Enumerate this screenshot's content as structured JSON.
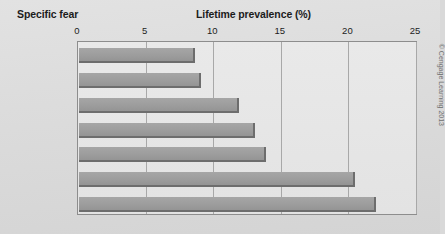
{
  "headings": {
    "category": "Specific fear",
    "value": "Lifetime prevalence (%)"
  },
  "credit": "© Cengage Learning 2013",
  "colors": {
    "bar_fill": "#9d9d9d",
    "bar_edge": "#6d6d6d",
    "plot_bg": "#e6e6e6",
    "frame": "#8d8d8d",
    "gridline": "#a8a8a8",
    "page_bg": "#dcdcdc",
    "text": "#1c1c1c"
  },
  "chart_data": {
    "type": "bar",
    "orientation": "horizontal",
    "title": "",
    "xlabel": "Lifetime prevalence (%)",
    "ylabel": "Specific fear",
    "xlim": [
      0,
      25
    ],
    "xticks": [
      0,
      5,
      10,
      15,
      20,
      25
    ],
    "xticklabels": [
      "0",
      "5",
      "10",
      "15",
      "20",
      "25"
    ],
    "grid": "vertical",
    "legend": "none",
    "categories": [
      "Storms",
      "Water",
      "Enclosed spaces",
      "Flying",
      "Blood",
      "Heights",
      "Animals"
    ],
    "values": [
      8.6,
      9.0,
      11.8,
      13.0,
      13.8,
      20.4,
      22.0
    ]
  }
}
